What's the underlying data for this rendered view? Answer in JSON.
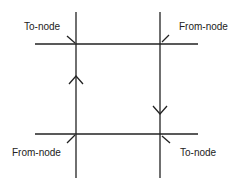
{
  "diagram": {
    "type": "network-edge-direction",
    "line_color": "#222222",
    "labels": {
      "top_left": "To-node",
      "top_right": "From-node",
      "bottom_left": "From-node",
      "bottom_right": "To-node"
    },
    "arrows": {
      "left_vertical": "up",
      "right_vertical": "down"
    }
  }
}
